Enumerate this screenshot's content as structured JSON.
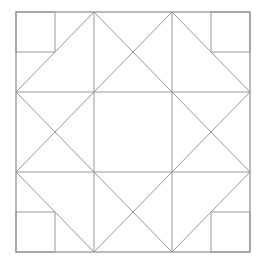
{
  "diagram": {
    "type": "quilt-block-line-drawing",
    "stroke_color": "#9a9a9a",
    "frame_color": "#8e8e8e",
    "background": "#ffffff",
    "outer_square": {
      "x": 16,
      "y": 12,
      "w": 234,
      "h": 240
    },
    "grid": {
      "cols_x": [
        16,
        94,
        172,
        250
      ],
      "rows_y": [
        12,
        92,
        172,
        252
      ]
    },
    "corner_squares": [
      {
        "name": "top-left",
        "x": 16,
        "y": 12,
        "w": 39,
        "h": 40
      },
      {
        "name": "top-right",
        "x": 211,
        "y": 12,
        "w": 39,
        "h": 40
      },
      {
        "name": "bottom-left",
        "x": 16,
        "y": 212,
        "w": 39,
        "h": 40
      },
      {
        "name": "bottom-right",
        "x": 211,
        "y": 212,
        "w": 39,
        "h": 40
      }
    ],
    "diagonals": [
      {
        "x1": 94,
        "y1": 12,
        "x2": 16,
        "y2": 92
      },
      {
        "x1": 94,
        "y1": 12,
        "x2": 172,
        "y2": 92
      },
      {
        "x1": 172,
        "y1": 12,
        "x2": 94,
        "y2": 92
      },
      {
        "x1": 172,
        "y1": 12,
        "x2": 250,
        "y2": 92
      },
      {
        "x1": 16,
        "y1": 92,
        "x2": 94,
        "y2": 172
      },
      {
        "x1": 16,
        "y1": 172,
        "x2": 94,
        "y2": 92
      },
      {
        "x1": 172,
        "y1": 92,
        "x2": 250,
        "y2": 172
      },
      {
        "x1": 172,
        "y1": 172,
        "x2": 250,
        "y2": 92
      },
      {
        "x1": 16,
        "y1": 172,
        "x2": 94,
        "y2": 252
      },
      {
        "x1": 94,
        "y1": 172,
        "x2": 172,
        "y2": 252
      },
      {
        "x1": 172,
        "y1": 172,
        "x2": 94,
        "y2": 252
      },
      {
        "x1": 250,
        "y1": 172,
        "x2": 172,
        "y2": 252
      }
    ]
  }
}
